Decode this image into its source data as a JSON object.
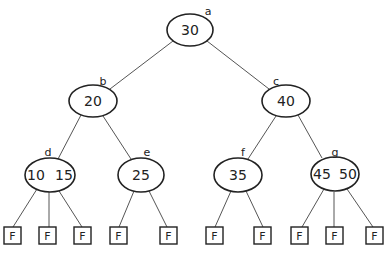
{
  "diagram": {
    "type": "2-3 tree",
    "nodes": [
      {
        "id": "a",
        "label": "a",
        "keys": [
          "30"
        ],
        "text": "30"
      },
      {
        "id": "b",
        "label": "b",
        "keys": [
          "20"
        ],
        "text": "20"
      },
      {
        "id": "c",
        "label": "c",
        "keys": [
          "40"
        ],
        "text": "40"
      },
      {
        "id": "d",
        "label": "d",
        "keys": [
          "10",
          "15"
        ],
        "k1": "10",
        "k2": "15"
      },
      {
        "id": "e",
        "label": "e",
        "keys": [
          "25"
        ],
        "text": "25"
      },
      {
        "id": "f",
        "label": "f",
        "keys": [
          "35"
        ],
        "text": "35"
      },
      {
        "id": "g",
        "label": "g",
        "keys": [
          "45",
          "50"
        ],
        "k1": "45",
        "k2": "50"
      }
    ],
    "edges": [
      [
        "a",
        "b"
      ],
      [
        "a",
        "c"
      ],
      [
        "b",
        "d"
      ],
      [
        "b",
        "e"
      ],
      [
        "c",
        "f"
      ],
      [
        "c",
        "g"
      ]
    ],
    "leaves": [
      {
        "parent": "d",
        "text": "F"
      },
      {
        "parent": "d",
        "text": "F"
      },
      {
        "parent": "d",
        "text": "F"
      },
      {
        "parent": "e",
        "text": "F"
      },
      {
        "parent": "e",
        "text": "F"
      },
      {
        "parent": "f",
        "text": "F"
      },
      {
        "parent": "f",
        "text": "F"
      },
      {
        "parent": "g",
        "text": "F"
      },
      {
        "parent": "g",
        "text": "F"
      },
      {
        "parent": "g",
        "text": "F"
      }
    ]
  }
}
